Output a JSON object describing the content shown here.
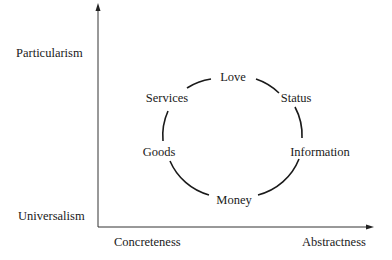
{
  "diagram": {
    "axes": {
      "y_top_label": "Particularism",
      "y_bottom_label": "Universalism",
      "x_left_label": "Concreteness",
      "x_right_label": "Abstractness"
    },
    "circle_nodes": [
      {
        "label": "Love",
        "position": "top"
      },
      {
        "label": "Status",
        "position": "upper-right"
      },
      {
        "label": "Information",
        "position": "lower-right"
      },
      {
        "label": "Money",
        "position": "bottom"
      },
      {
        "label": "Goods",
        "position": "lower-left"
      },
      {
        "label": "Services",
        "position": "upper-left"
      }
    ],
    "colors": {
      "line": "#1a1a1a",
      "background": "#ffffff"
    }
  }
}
